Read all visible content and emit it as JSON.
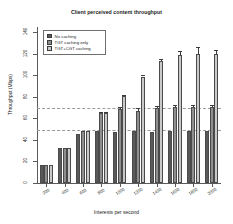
{
  "chart_data": {
    "type": "bar",
    "title": "Client perceived content throughput",
    "xlabel": "Interests per second",
    "ylabel": "Throughput (Mbps)",
    "categories": [
      "200",
      "400",
      "600",
      "800",
      "1000",
      "1200",
      "1400",
      "1600",
      "1800",
      "2000"
    ],
    "ylim": [
      0,
      145
    ],
    "yticks": [
      0,
      20,
      40,
      60,
      80,
      100,
      120,
      140
    ],
    "ytick_labels": [
      "0",
      "20",
      "40",
      "60",
      "80",
      "100",
      "120",
      "140"
    ],
    "grid": false,
    "legend_position": "top-left inside plot",
    "series": [
      {
        "name": "No caching",
        "color": "#595959",
        "values": [
          17,
          33,
          46,
          48,
          47,
          48,
          47,
          48,
          48,
          48
        ],
        "errors": [
          0,
          0,
          0,
          0,
          0,
          0,
          0,
          0,
          0,
          0
        ]
      },
      {
        "name": "TGT caching only",
        "color": "#8f8f8f",
        "values": [
          17,
          33,
          48,
          65,
          69,
          67,
          70,
          71,
          71,
          71
        ],
        "errors": [
          0,
          0,
          0,
          1,
          1.5,
          3,
          2,
          1.5,
          1.5,
          1.5
        ]
      },
      {
        "name": "TGT+CGT caching",
        "color": "#c9c9c9",
        "values": [
          17,
          33,
          48,
          65,
          81,
          99,
          113,
          119,
          120,
          120
        ],
        "errors": [
          0,
          0,
          0,
          1,
          1,
          1.5,
          2.5,
          4,
          6,
          4
        ]
      }
    ],
    "reference_lines": [
      {
        "value": 70,
        "style": "dashed",
        "color": "#9a9a9a"
      },
      {
        "value": 49,
        "style": "dashed",
        "color": "#9a9a9a"
      }
    ]
  }
}
